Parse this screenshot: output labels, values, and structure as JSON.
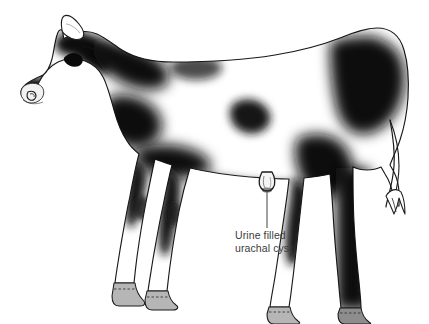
{
  "figure": {
    "breed_pattern": "holstein-black-and-white",
    "view": "left lateral standing",
    "background_color": "#ffffff",
    "ink_color": "#1a1a1a",
    "hoof_color": "#b4b4b4",
    "label_color": "#3b3b3b",
    "leader_line_color": "#4a4a4a"
  },
  "annotation": {
    "name": "urachal-cyst-callout",
    "line1": "Urine filled",
    "line2": "urachal cyst",
    "leader": {
      "from_x": 267,
      "from_y": 192,
      "to_x": 267,
      "to_y": 228
    },
    "text_x": 235,
    "text_y": 229
  },
  "anatomy": {
    "parts": [
      {
        "name": "head",
        "label": "Head"
      },
      {
        "name": "ear",
        "label": "Ear"
      },
      {
        "name": "eye",
        "label": "Eye"
      },
      {
        "name": "muzzle",
        "label": "Muzzle"
      },
      {
        "name": "nostril",
        "label": "Nostril"
      },
      {
        "name": "neck",
        "label": "Neck"
      },
      {
        "name": "body",
        "label": "Body"
      },
      {
        "name": "foreleg-near",
        "label": "Near foreleg"
      },
      {
        "name": "foreleg-far",
        "label": "Far foreleg"
      },
      {
        "name": "hindleg-near",
        "label": "Near hindleg"
      },
      {
        "name": "hindleg-far",
        "label": "Far hindleg"
      },
      {
        "name": "tail",
        "label": "Tail"
      },
      {
        "name": "tail-tuft",
        "label": "Tail tuft"
      },
      {
        "name": "hoof",
        "label": "Hoof"
      },
      {
        "name": "urachal-cyst",
        "label": "Urine filled urachal cyst"
      }
    ]
  }
}
